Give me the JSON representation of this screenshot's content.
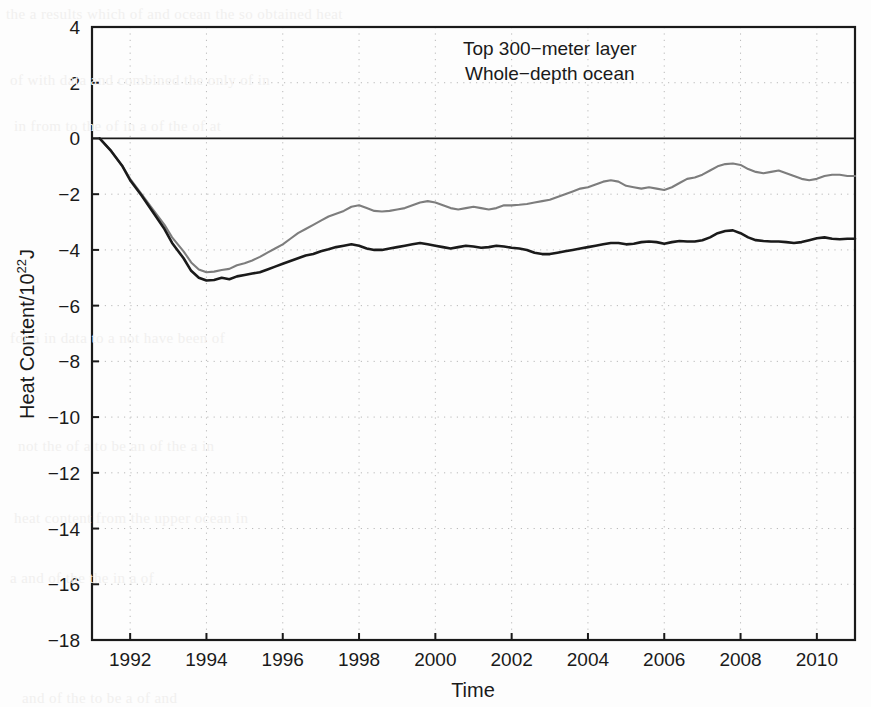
{
  "chart_data": {
    "type": "line",
    "title": "",
    "xlabel": "Time",
    "ylabel": "Heat Content/10",
    "ylabel_sup": "22",
    "ylabel_tail": "J",
    "xlim": [
      1991.0,
      1911.0
    ],
    "x_axis_range": [
      1991.0,
      1911.0
    ],
    "xrange": [
      1991.0,
      2011.0
    ],
    "ylim": [
      -18,
      4
    ],
    "grid": true,
    "grid_style": "dotted",
    "legend_position": "top-right-inside",
    "xticks": [
      1992,
      1994,
      1996,
      1998,
      2000,
      2002,
      2004,
      2006,
      2008,
      2010
    ],
    "xticklabels": [
      "1992",
      "1994",
      "1996",
      "1998",
      "2000",
      "2002",
      "2004",
      "2006",
      "2008",
      "2010"
    ],
    "yticks": [
      4,
      2,
      0,
      -2,
      -4,
      -6,
      -8,
      -10,
      -12,
      -14,
      -16,
      -18
    ],
    "yticklabels": [
      "4",
      "2",
      "0",
      "-2",
      "-4",
      "-6",
      "-8",
      "-10",
      "-12",
      "-14",
      "-16",
      "-18"
    ],
    "zero_line": 0,
    "series": [
      {
        "name": "Top 300-meter layer",
        "color": "#7d7d7d",
        "legend_label": "Top 300−meter layer",
        "x": [
          1991.2,
          1991.5,
          1991.8,
          1992.0,
          1992.3,
          1992.6,
          1992.9,
          1993.1,
          1993.4,
          1993.6,
          1993.8,
          1994.0,
          1994.2,
          1994.4,
          1994.6,
          1994.8,
          1995.0,
          1995.2,
          1995.4,
          1995.6,
          1995.8,
          1996.0,
          1996.2,
          1996.4,
          1996.6,
          1996.8,
          1997.0,
          1997.2,
          1997.4,
          1997.6,
          1997.8,
          1998.0,
          1998.2,
          1998.4,
          1998.6,
          1998.8,
          1999.0,
          1999.2,
          1999.4,
          1999.6,
          1999.8,
          2000.0,
          2000.2,
          2000.4,
          2000.6,
          2000.8,
          2001.0,
          2001.2,
          2001.4,
          2001.6,
          2001.8,
          2002.0,
          2002.2,
          2002.4,
          2002.6,
          2002.8,
          2003.0,
          2003.2,
          2003.4,
          2003.6,
          2003.8,
          2004.0,
          2004.2,
          2004.4,
          2004.6,
          2004.8,
          2005.0,
          2005.2,
          2005.4,
          2005.6,
          2005.8,
          2006.0,
          2006.2,
          2006.4,
          2006.6,
          2006.8,
          2007.0,
          2007.2,
          2007.4,
          2007.6,
          2007.8,
          2008.0,
          2008.2,
          2008.4,
          2008.6,
          2008.8,
          2009.0,
          2009.2,
          2009.4,
          2009.6,
          2009.8,
          2010.0,
          2010.2,
          2010.4,
          2010.6,
          2010.8,
          2011.0
        ],
        "y": [
          0.0,
          -0.45,
          -1.0,
          -1.45,
          -2.0,
          -2.55,
          -3.1,
          -3.55,
          -4.05,
          -4.45,
          -4.7,
          -4.8,
          -4.78,
          -4.72,
          -4.68,
          -4.55,
          -4.48,
          -4.38,
          -4.25,
          -4.1,
          -3.95,
          -3.8,
          -3.6,
          -3.4,
          -3.25,
          -3.1,
          -2.95,
          -2.8,
          -2.7,
          -2.6,
          -2.45,
          -2.4,
          -2.5,
          -2.6,
          -2.62,
          -2.6,
          -2.55,
          -2.5,
          -2.4,
          -2.3,
          -2.25,
          -2.3,
          -2.4,
          -2.5,
          -2.55,
          -2.5,
          -2.45,
          -2.5,
          -2.55,
          -2.5,
          -2.4,
          -2.4,
          -2.38,
          -2.35,
          -2.3,
          -2.25,
          -2.2,
          -2.1,
          -2.0,
          -1.9,
          -1.8,
          -1.75,
          -1.65,
          -1.55,
          -1.5,
          -1.55,
          -1.7,
          -1.75,
          -1.8,
          -1.75,
          -1.8,
          -1.85,
          -1.75,
          -1.6,
          -1.45,
          -1.4,
          -1.3,
          -1.15,
          -1.0,
          -0.92,
          -0.9,
          -0.95,
          -1.1,
          -1.2,
          -1.25,
          -1.2,
          -1.15,
          -1.25,
          -1.35,
          -1.45,
          -1.5,
          -1.45,
          -1.35,
          -1.3,
          -1.3,
          -1.35,
          -1.35
        ]
      },
      {
        "name": "Whole-depth ocean",
        "color": "#1a1a1a",
        "legend_label": "Whole−depth ocean",
        "x": [
          1991.2,
          1991.5,
          1991.8,
          1992.0,
          1992.3,
          1992.6,
          1992.9,
          1993.1,
          1993.4,
          1993.6,
          1993.8,
          1994.0,
          1994.2,
          1994.4,
          1994.6,
          1994.8,
          1995.0,
          1995.2,
          1995.4,
          1995.6,
          1995.8,
          1996.0,
          1996.2,
          1996.4,
          1996.6,
          1996.8,
          1997.0,
          1997.2,
          1997.4,
          1997.6,
          1997.8,
          1998.0,
          1998.2,
          1998.4,
          1998.6,
          1998.8,
          1999.0,
          1999.2,
          1999.4,
          1999.6,
          1999.8,
          2000.0,
          2000.2,
          2000.4,
          2000.6,
          2000.8,
          2001.0,
          2001.2,
          2001.4,
          2001.6,
          2001.8,
          2002.0,
          2002.2,
          2002.4,
          2002.6,
          2002.8,
          2003.0,
          2003.2,
          2003.4,
          2003.6,
          2003.8,
          2004.0,
          2004.2,
          2004.4,
          2004.6,
          2004.8,
          2005.0,
          2005.2,
          2005.4,
          2005.6,
          2005.8,
          2006.0,
          2006.2,
          2006.4,
          2006.6,
          2006.8,
          2007.0,
          2007.2,
          2007.4,
          2007.6,
          2007.8,
          2008.0,
          2008.2,
          2008.4,
          2008.6,
          2008.8,
          2009.0,
          2009.2,
          2009.4,
          2009.6,
          2009.8,
          2010.0,
          2010.2,
          2010.4,
          2010.6,
          2010.8,
          2011.0
        ],
        "y": [
          0.0,
          -0.45,
          -1.0,
          -1.5,
          -2.05,
          -2.65,
          -3.25,
          -3.75,
          -4.3,
          -4.75,
          -5.0,
          -5.1,
          -5.08,
          -5.0,
          -5.05,
          -4.95,
          -4.9,
          -4.85,
          -4.8,
          -4.7,
          -4.6,
          -4.5,
          -4.4,
          -4.3,
          -4.2,
          -4.15,
          -4.05,
          -3.98,
          -3.9,
          -3.85,
          -3.8,
          -3.85,
          -3.95,
          -4.0,
          -4.0,
          -3.95,
          -3.9,
          -3.85,
          -3.8,
          -3.75,
          -3.8,
          -3.85,
          -3.9,
          -3.95,
          -3.9,
          -3.85,
          -3.88,
          -3.92,
          -3.9,
          -3.85,
          -3.88,
          -3.92,
          -3.95,
          -4.0,
          -4.1,
          -4.15,
          -4.15,
          -4.1,
          -4.05,
          -4.0,
          -3.95,
          -3.9,
          -3.85,
          -3.8,
          -3.75,
          -3.75,
          -3.8,
          -3.78,
          -3.72,
          -3.7,
          -3.72,
          -3.78,
          -3.72,
          -3.68,
          -3.7,
          -3.7,
          -3.65,
          -3.55,
          -3.4,
          -3.32,
          -3.3,
          -3.4,
          -3.55,
          -3.65,
          -3.68,
          -3.7,
          -3.7,
          -3.72,
          -3.75,
          -3.72,
          -3.65,
          -3.58,
          -3.55,
          -3.6,
          -3.62,
          -3.6,
          -3.6
        ]
      }
    ],
    "annotations": [
      {
        "text": "Top 300−meter layer",
        "x": 2003.0,
        "y": 3.0,
        "color": "#7d7d7d"
      },
      {
        "text": "Whole−depth ocean",
        "x": 2003.0,
        "y": 2.1,
        "color": "#1a1a1a"
      }
    ]
  },
  "axis": {
    "x_title": "Time",
    "y_title_main": "Heat Content/10",
    "y_title_exponent": "22",
    "y_title_unit": "J"
  },
  "background_bleed": [
    "the a results which of and ocean the so obtained heat",
    "of with data and combined the only of in",
    "in from to the of in a of the of at",
    "for a in data to a not have been of",
    "not the of a to be an of the a in",
    "heat content from the upper ocean in",
    "a and of the the in a of",
    "and of the to be a of and"
  ]
}
